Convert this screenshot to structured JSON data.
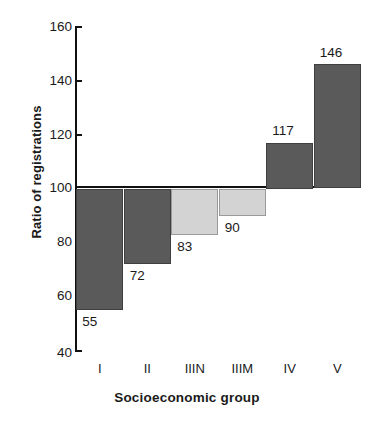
{
  "chart_data": {
    "type": "bar",
    "title": "",
    "subtitle": "",
    "xlabel": "Socioeconomic group",
    "ylabel": "Ratio of registrations",
    "categories": [
      "I",
      "II",
      "IIIN",
      "IIIM",
      "IV",
      "V"
    ],
    "values": [
      55,
      72,
      83,
      90,
      117,
      146
    ],
    "value_labels": [
      "55",
      "72",
      "83",
      "90",
      "117",
      "146"
    ],
    "series": [
      {
        "name": "Ratio of registrations",
        "values": [
          55,
          72,
          83,
          90,
          117,
          146
        ]
      }
    ],
    "baseline": 100,
    "ylim": [
      40,
      160
    ],
    "yticks": [
      40,
      60,
      80,
      100,
      120,
      140,
      160
    ],
    "ytick_labels": [
      "40",
      "60",
      "80",
      "100",
      "120",
      "140",
      "160"
    ],
    "grid": false,
    "legend": null,
    "bar_styles": [
      "dark",
      "dark",
      "light",
      "light",
      "dark",
      "dark"
    ],
    "colors": {
      "dark_fill": "#5a5a5a",
      "dark_edge": "#3f3f3f",
      "light_fill": "#d3d3d3",
      "light_edge": "#9a9a9a",
      "axis": "#111111",
      "text": "#1a1a1a",
      "background": "#ffffff"
    }
  }
}
